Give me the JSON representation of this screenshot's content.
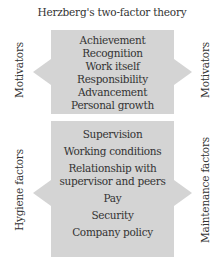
{
  "title": "Herzberg's two-factor theory",
  "motivators": {
    "left_label": "Motivators",
    "right_label": "Motivators",
    "items": [
      "Achievement",
      "Recognition",
      "Work itself",
      "Responsibility",
      "Advancement",
      "Personal growth"
    ]
  },
  "hygiene": {
    "left_label": "Hygiene factors",
    "right_label": "Maintenance factors",
    "items": [
      "Supervision",
      "Working conditions",
      "Relationship with supervisor and peers",
      "Pay",
      "Security",
      "Company policy"
    ],
    "items_display": [
      "Supervision",
      "Working conditions",
      "Relationship with\nsupervisor and peers",
      "Pay",
      "Security",
      "Company policy"
    ]
  },
  "colors": {
    "box_fill": "#d4d4d4",
    "text": "#333333",
    "background": "#ffffff"
  }
}
